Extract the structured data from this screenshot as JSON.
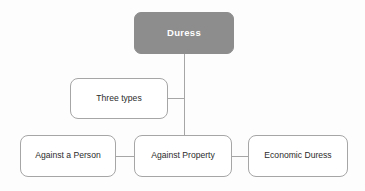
{
  "diagram": {
    "type": "hierarchy-flowchart",
    "title_node": "Duress",
    "background_color": "#fdfdfd",
    "root_fill_color": "#8d8d8d",
    "root_text_color": "#ffffff",
    "node_border_color": "#a6a6a6",
    "node_fill_color": "#ffffff",
    "node_text_color": "#2b2b2b",
    "connector_color": "#a6a6a6",
    "nodes": [
      {
        "id": "duress",
        "label": "Duress",
        "style": "filled-gray",
        "x": 134,
        "y": 12,
        "width": 100,
        "height": 42
      },
      {
        "id": "three-types",
        "label": "Three types",
        "style": "outlined",
        "x": 70,
        "y": 78,
        "width": 98,
        "height": 41
      },
      {
        "id": "against-a-person",
        "label": "Against a Person",
        "style": "outlined",
        "x": 20,
        "y": 135,
        "width": 96,
        "height": 42
      },
      {
        "id": "against-property",
        "label": "Against Property",
        "style": "outlined",
        "x": 134,
        "y": 135,
        "width": 98,
        "height": 42
      },
      {
        "id": "economic-duress",
        "label": "Economic Duress",
        "style": "outlined",
        "x": 248,
        "y": 135,
        "width": 100,
        "height": 42
      }
    ],
    "edges": [
      {
        "from": "duress",
        "to": "against-property",
        "kind": "vertical-trunk"
      },
      {
        "from": "three-types",
        "to": "trunk",
        "kind": "horizontal-branch"
      },
      {
        "from": "against-a-person",
        "to": "against-property",
        "kind": "horizontal"
      },
      {
        "from": "against-property",
        "to": "economic-duress",
        "kind": "horizontal"
      }
    ]
  }
}
